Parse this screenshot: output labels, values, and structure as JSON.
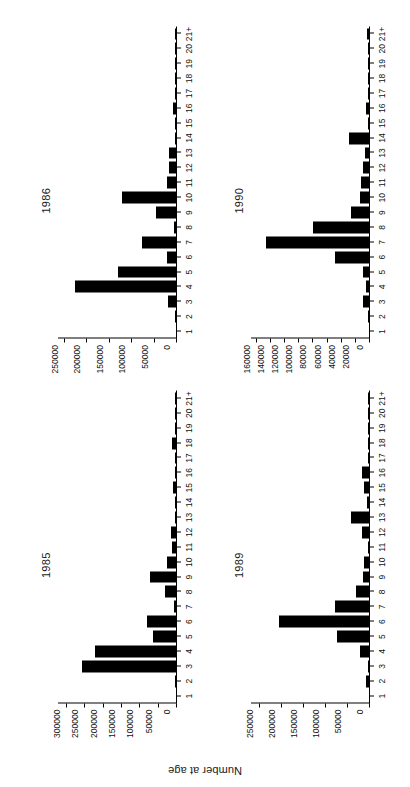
{
  "figure": {
    "ylabel": "Number at age",
    "panel_order": [
      "p1985",
      "p1986",
      "p1989",
      "p1990"
    ]
  },
  "categories": [
    "1",
    "2",
    "3",
    "4",
    "5",
    "6",
    "7",
    "8",
    "9",
    "10",
    "11",
    "12",
    "13",
    "14",
    "15",
    "16",
    "17",
    "18",
    "19",
    "20",
    "21+"
  ],
  "chart_data": [
    {
      "type": "bar",
      "title": "1985",
      "xlabel": "",
      "ylabel": "Number at age",
      "orientation": "vertical",
      "grid": false,
      "legend": "none",
      "ylim": [
        0,
        325000
      ],
      "yticks": [
        0,
        50000,
        100000,
        150000,
        200000,
        250000,
        300000
      ],
      "ytick_labels": [
        "0",
        "50000",
        "100000",
        "150000",
        "200000",
        "250000",
        "300000"
      ],
      "categories": [
        "1",
        "2",
        "3",
        "4",
        "5",
        "6",
        "7",
        "8",
        "9",
        "10",
        "11",
        "12",
        "13",
        "14",
        "15",
        "16",
        "17",
        "18",
        "19",
        "20",
        "21+"
      ],
      "values": [
        0,
        1000,
        258000,
        222000,
        63000,
        78000,
        5000,
        29000,
        72000,
        24000,
        12000,
        13000,
        2000,
        1500,
        8000,
        1500,
        1000,
        11000,
        1000,
        500,
        500
      ]
    },
    {
      "type": "bar",
      "title": "1986",
      "xlabel": "",
      "ylabel": "Number at age",
      "orientation": "vertical",
      "grid": false,
      "legend": "none",
      "ylim": [
        0,
        265000
      ],
      "yticks": [
        0,
        50000,
        100000,
        150000,
        200000,
        250000
      ],
      "ytick_labels": [
        "0",
        "50000",
        "100000",
        "150000",
        "200000",
        "250000"
      ],
      "categories": [
        "1",
        "2",
        "3",
        "4",
        "5",
        "6",
        "7",
        "8",
        "9",
        "10",
        "11",
        "12",
        "13",
        "14",
        "15",
        "16",
        "17",
        "18",
        "19",
        "20",
        "21+"
      ],
      "values": [
        0,
        500,
        18000,
        224000,
        130000,
        19000,
        75000,
        4000,
        44000,
        121000,
        20000,
        15000,
        15000,
        3000,
        1500,
        6000,
        1000,
        500,
        500,
        500,
        2500
      ]
    },
    {
      "type": "bar",
      "title": "1989",
      "xlabel": "",
      "ylabel": "Number at age",
      "orientation": "vertical",
      "grid": false,
      "legend": "none",
      "ylim": [
        0,
        270000
      ],
      "yticks": [
        0,
        50000,
        100000,
        150000,
        200000,
        250000
      ],
      "ytick_labels": [
        "0",
        "50000",
        "100000",
        "150000",
        "200000",
        "250000"
      ],
      "categories": [
        "1",
        "2",
        "3",
        "4",
        "5",
        "6",
        "7",
        "8",
        "9",
        "10",
        "11",
        "12",
        "13",
        "14",
        "15",
        "16",
        "17",
        "18",
        "19",
        "20",
        "21+"
      ],
      "values": [
        0,
        7000,
        2000,
        20000,
        73000,
        205000,
        77000,
        30000,
        13000,
        12000,
        3000,
        17000,
        42000,
        4000,
        12000,
        17000,
        3000,
        1000,
        1000,
        500,
        1500
      ]
    },
    {
      "type": "bar",
      "title": "1990",
      "xlabel": "",
      "ylabel": "Number at age",
      "orientation": "vertical",
      "grid": false,
      "legend": "none",
      "ylim": [
        0,
        168000
      ],
      "yticks": [
        0,
        20000,
        40000,
        60000,
        80000,
        100000,
        120000,
        140000,
        160000
      ],
      "ytick_labels": [
        "0",
        "20000",
        "40000",
        "60000",
        "80000",
        "100000",
        "120000",
        "140000",
        "160000"
      ],
      "categories": [
        "1",
        "2",
        "3",
        "4",
        "5",
        "6",
        "7",
        "8",
        "9",
        "10",
        "11",
        "12",
        "13",
        "14",
        "15",
        "16",
        "17",
        "18",
        "19",
        "20",
        "21+"
      ],
      "values": [
        0,
        500,
        8000,
        4000,
        9000,
        48000,
        146000,
        79000,
        25000,
        13000,
        11000,
        8000,
        5000,
        28000,
        1500,
        4000,
        1500,
        2000,
        500,
        500,
        3000
      ]
    }
  ]
}
